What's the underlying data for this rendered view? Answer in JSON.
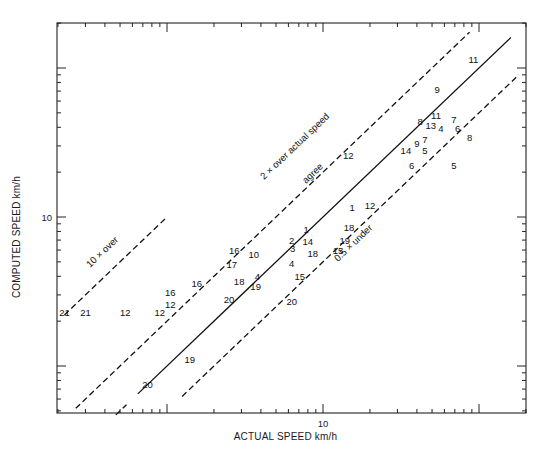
{
  "chart_data": {
    "type": "scatter",
    "title": "",
    "xlabel": "ACTUAL SPEED km/h",
    "ylabel": "COMPUTED SPEED km/h",
    "xscale": "log",
    "yscale": "log",
    "xlim": [
      0.2,
      200
    ],
    "ylim": [
      0.5,
      200
    ],
    "grid": false,
    "legend": null,
    "x_tick_labels": [
      {
        "value": 10,
        "label": "10"
      }
    ],
    "y_tick_labels": [
      {
        "value": 10,
        "label": "10"
      }
    ],
    "reference_lines": [
      {
        "name": "10x over",
        "label": "10 × over",
        "ratio": 10,
        "style": "dashed",
        "x_range": [
          0.22,
          1.0
        ]
      },
      {
        "name": "2x over actual speed",
        "label": "2 × over actual speed",
        "ratio": 2,
        "style": "dashed",
        "x_range": [
          0.26,
          87
        ]
      },
      {
        "name": "agree",
        "label": "agree",
        "ratio": 1,
        "style": "solid",
        "x_range": [
          0.65,
          160
        ]
      },
      {
        "name": "0.5x under",
        "label": "0.5 × under",
        "ratio": 0.5,
        "style": "dashed",
        "x_range": [
          1.25,
          180
        ]
      }
    ],
    "points": [
      {
        "label": "21",
        "actual": 0.22,
        "computed": 2.3
      },
      {
        "label": "21",
        "actual": 0.3,
        "computed": 2.3
      },
      {
        "label": "12",
        "actual": 0.54,
        "computed": 2.3
      },
      {
        "label": "12",
        "actual": 0.9,
        "computed": 2.3
      },
      {
        "label": "12",
        "actual": 1.05,
        "computed": 2.6
      },
      {
        "label": "16",
        "actual": 1.05,
        "computed": 3.1
      },
      {
        "label": "16",
        "actual": 1.55,
        "computed": 3.6
      },
      {
        "label": "20",
        "actual": 2.5,
        "computed": 2.8
      },
      {
        "label": "20",
        "actual": 0.75,
        "computed": 0.75
      },
      {
        "label": "19",
        "actual": 1.4,
        "computed": 1.1
      },
      {
        "label": "17",
        "actual": 2.6,
        "computed": 4.8
      },
      {
        "label": "16",
        "actual": 2.7,
        "computed": 6.0
      },
      {
        "label": "10",
        "actual": 3.6,
        "computed": 5.6
      },
      {
        "label": "18",
        "actual": 2.9,
        "computed": 3.7
      },
      {
        "label": "4",
        "actual": 3.8,
        "computed": 4.0
      },
      {
        "label": "19",
        "actual": 3.7,
        "computed": 3.4
      },
      {
        "label": "20",
        "actual": 6.3,
        "computed": 2.7
      },
      {
        "label": "4",
        "actual": 6.3,
        "computed": 4.9
      },
      {
        "label": "15",
        "actual": 7.1,
        "computed": 4.0
      },
      {
        "label": "2",
        "actual": 6.3,
        "computed": 7.0
      },
      {
        "label": "3",
        "actual": 6.4,
        "computed": 6.1
      },
      {
        "label": "1",
        "actual": 7.8,
        "computed": 8.2
      },
      {
        "label": "14",
        "actual": 8.0,
        "computed": 6.8
      },
      {
        "label": "18",
        "actual": 8.6,
        "computed": 5.7
      },
      {
        "label": "15",
        "actual": 12.5,
        "computed": 6.0
      },
      {
        "label": "19",
        "actual": 13.8,
        "computed": 7.0
      },
      {
        "label": "18",
        "actual": 14.7,
        "computed": 8.5
      },
      {
        "label": "1",
        "actual": 15.4,
        "computed": 11.5
      },
      {
        "label": "12",
        "actual": 20,
        "computed": 12
      },
      {
        "label": "12",
        "actual": 14.5,
        "computed": 26
      },
      {
        "label": "6",
        "actual": 37,
        "computed": 22
      },
      {
        "label": "14",
        "actual": 34,
        "computed": 28
      },
      {
        "label": "9",
        "actual": 40,
        "computed": 31
      },
      {
        "label": "7",
        "actual": 45,
        "computed": 33
      },
      {
        "label": "5",
        "actual": 45,
        "computed": 28
      },
      {
        "label": "8",
        "actual": 42,
        "computed": 44
      },
      {
        "label": "13",
        "actual": 49,
        "computed": 41
      },
      {
        "label": "4",
        "actual": 57,
        "computed": 39
      },
      {
        "label": "11",
        "actual": 53,
        "computed": 48
      },
      {
        "label": "7",
        "actual": 69,
        "computed": 45
      },
      {
        "label": "6",
        "actual": 73,
        "computed": 39
      },
      {
        "label": "8",
        "actual": 87,
        "computed": 34
      },
      {
        "label": "5",
        "actual": 69,
        "computed": 22
      },
      {
        "label": "9",
        "actual": 54,
        "computed": 72
      },
      {
        "label": "11",
        "actual": 92,
        "computed": 114
      }
    ]
  }
}
